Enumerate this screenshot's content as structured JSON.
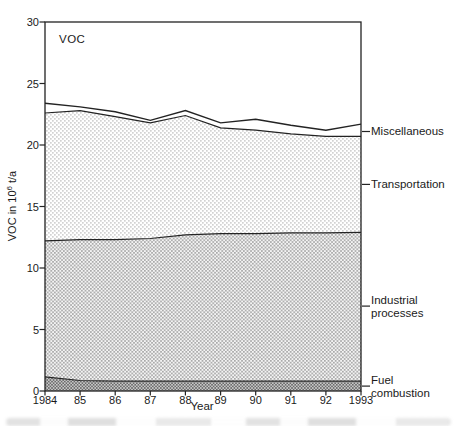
{
  "window": {
    "width": 457,
    "height": 426,
    "background": "#ffffff"
  },
  "figure": {
    "inner_label": "VOC",
    "x_axis_title": "Year",
    "y_axis_title": {
      "prefix": "VOC in 10",
      "exponent": "6",
      "suffix": " t/a"
    }
  },
  "chart_data": {
    "type": "area",
    "stacked": true,
    "title": "VOC",
    "xlabel": "Year",
    "ylabel": "VOC in 10^6 t/a",
    "ylim": [
      0,
      30
    ],
    "grid": false,
    "legend_position": "right-outside",
    "x": [
      1984,
      1985,
      1986,
      1987,
      1988,
      1989,
      1990,
      1991,
      1992,
      1993
    ],
    "x_tick_labels": [
      "1984",
      "85",
      "86",
      "87",
      "88",
      "89",
      "90",
      "91",
      "92",
      "1993"
    ],
    "y_ticks": [
      0,
      5,
      10,
      15,
      20,
      25,
      30
    ],
    "series": [
      {
        "name": "Fuel combustion",
        "pattern": "dark-checker",
        "values": [
          1.15,
          0.85,
          0.8,
          0.8,
          0.8,
          0.8,
          0.8,
          0.8,
          0.8,
          0.8
        ],
        "label_anchor": 0.4
      },
      {
        "name": "Industrial processes",
        "pattern": "medium-dots",
        "values": [
          11.05,
          11.45,
          11.5,
          11.6,
          11.9,
          12.0,
          12.0,
          12.05,
          12.05,
          12.1
        ],
        "label_anchor": 6.9
      },
      {
        "name": "Transportation",
        "pattern": "light-dots",
        "values": [
          10.4,
          10.5,
          10.0,
          9.4,
          9.7,
          8.6,
          8.4,
          8.05,
          7.85,
          7.8
        ],
        "label_anchor": 16.8
      },
      {
        "name": "Miscellaneous",
        "pattern": "none",
        "values": [
          0.8,
          0.3,
          0.4,
          0.2,
          0.4,
          0.4,
          0.9,
          0.7,
          0.5,
          1.0
        ],
        "label_anchor": 21.1
      }
    ],
    "stacked_totals": [
      23.4,
      23.1,
      22.7,
      22.0,
      22.8,
      21.8,
      22.1,
      21.6,
      21.2,
      21.7
    ]
  },
  "colors": {
    "line": "#232323",
    "text": "#1a1a1a",
    "pattern_light_dot": "#d2d2d2",
    "pattern_medium_dot": "#a8a8a8",
    "pattern_medium_bg": "#f4f4f4",
    "pattern_dark_dot": "#6b6b6b",
    "pattern_dark_bg": "#c9c9c9"
  }
}
